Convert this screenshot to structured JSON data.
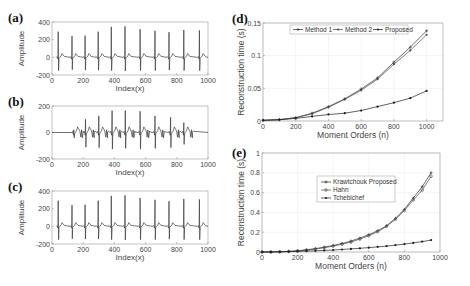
{
  "figure": {
    "panels": [
      "(a)",
      "(b)",
      "(c)",
      "(d)",
      "(e)"
    ]
  },
  "chart_data": [
    {
      "id": "a",
      "type": "line",
      "label": "(a)",
      "title": "",
      "xlabel": "Index(x)",
      "ylabel": "Amplitude",
      "xlim": [
        0,
        1000
      ],
      "ylim": [
        -200,
        400
      ],
      "xticks": [
        0,
        200,
        400,
        600,
        800,
        1000
      ],
      "yticks": [
        -200,
        0,
        200,
        400
      ],
      "signal": "ECG original",
      "beats": [
        {
          "x": 40,
          "r": 290,
          "s": -150
        },
        {
          "x": 128,
          "r": 240,
          "s": -140
        },
        {
          "x": 212,
          "r": 245,
          "s": -145
        },
        {
          "x": 296,
          "r": 290,
          "s": -145
        },
        {
          "x": 380,
          "r": 345,
          "s": -150
        },
        {
          "x": 468,
          "r": 350,
          "s": -155
        },
        {
          "x": 565,
          "r": 320,
          "s": -150
        },
        {
          "x": 660,
          "r": 300,
          "s": -150
        },
        {
          "x": 750,
          "r": 285,
          "s": -145
        },
        {
          "x": 845,
          "r": 310,
          "s": -150
        },
        {
          "x": 945,
          "r": 305,
          "s": -150
        }
      ],
      "grid": false
    },
    {
      "id": "b",
      "type": "line",
      "label": "(b)",
      "title": "",
      "xlabel": "Index(x)",
      "ylabel": "Amplitude",
      "xlim": [
        0,
        1000
      ],
      "ylim": [
        -200,
        200
      ],
      "xticks": [
        0,
        200,
        400,
        600,
        800,
        1000
      ],
      "yticks": [
        -200,
        0,
        200
      ],
      "signal": "ECG noisy/windowed",
      "active_range": [
        130,
        900
      ],
      "beats": [
        {
          "x": 140,
          "r": 20,
          "s": -40
        },
        {
          "x": 215,
          "r": 100,
          "s": -110
        },
        {
          "x": 300,
          "r": 125,
          "s": -115
        },
        {
          "x": 385,
          "r": 165,
          "s": -125
        },
        {
          "x": 470,
          "r": 165,
          "s": -120
        },
        {
          "x": 565,
          "r": 160,
          "s": -125
        },
        {
          "x": 660,
          "r": 125,
          "s": -120
        },
        {
          "x": 760,
          "r": 115,
          "s": -115
        },
        {
          "x": 845,
          "r": 75,
          "s": -90
        }
      ],
      "grid": false
    },
    {
      "id": "c",
      "type": "line",
      "label": "(c)",
      "title": "",
      "xlabel": "Index(x)",
      "ylabel": "Amplitude",
      "xlim": [
        0,
        1000
      ],
      "ylim": [
        -200,
        400
      ],
      "xticks": [
        0,
        200,
        400,
        600,
        800,
        1000
      ],
      "yticks": [
        -200,
        0,
        200,
        400
      ],
      "signal": "ECG reconstructed",
      "beats": [
        {
          "x": 40,
          "r": 290,
          "s": -150
        },
        {
          "x": 128,
          "r": 240,
          "s": -140
        },
        {
          "x": 212,
          "r": 245,
          "s": -145
        },
        {
          "x": 296,
          "r": 290,
          "s": -145
        },
        {
          "x": 380,
          "r": 345,
          "s": -150
        },
        {
          "x": 468,
          "r": 350,
          "s": -155
        },
        {
          "x": 565,
          "r": 320,
          "s": -150
        },
        {
          "x": 660,
          "r": 300,
          "s": -150
        },
        {
          "x": 750,
          "r": 285,
          "s": -145
        },
        {
          "x": 845,
          "r": 310,
          "s": -150
        },
        {
          "x": 945,
          "r": 305,
          "s": -150
        }
      ],
      "grid": false
    },
    {
      "id": "d",
      "type": "line",
      "label": "(d)",
      "title": "",
      "xlabel": "Moment Orders (n)",
      "ylabel": "Reconstruction time (s)",
      "xlim": [
        0,
        1100
      ],
      "ylim": [
        0,
        0.15
      ],
      "xticks": [
        0,
        200,
        400,
        600,
        800,
        1000
      ],
      "yticks": [
        0,
        0.05,
        0.1,
        0.15
      ],
      "ytick_labels": [
        "0",
        "0.05",
        "0.1",
        "0.15"
      ],
      "legend_position": "top (horizontal)",
      "grid": true,
      "x": [
        0,
        100,
        200,
        300,
        400,
        500,
        600,
        700,
        800,
        900,
        1000
      ],
      "series": [
        {
          "name": "Method 1",
          "marker": "+",
          "values": [
            0.001,
            0.002,
            0.005,
            0.012,
            0.022,
            0.034,
            0.049,
            0.066,
            0.09,
            0.113,
            0.138
          ]
        },
        {
          "name": "Method 2",
          "marker": "*",
          "values": [
            0.001,
            0.002,
            0.005,
            0.011,
            0.021,
            0.033,
            0.047,
            0.064,
            0.087,
            0.108,
            0.132
          ]
        },
        {
          "name": "Proposed",
          "marker": ".",
          "values": [
            0.001,
            0.002,
            0.004,
            0.007,
            0.01,
            0.012,
            0.016,
            0.022,
            0.028,
            0.035,
            0.046
          ]
        }
      ]
    },
    {
      "id": "e",
      "type": "line",
      "label": "(e)",
      "title": "",
      "xlabel": "Moment Orders (n)",
      "ylabel": "Reconstruction time (s)",
      "xlim": [
        0,
        1000
      ],
      "ylim": [
        0,
        1
      ],
      "xticks": [
        0,
        200,
        400,
        600,
        800,
        1000
      ],
      "yticks": [
        0,
        0.2,
        0.4,
        0.6,
        0.8,
        1
      ],
      "ytick_labels": [
        "0",
        "0.2",
        "0.4",
        "0.6",
        "0.8",
        "1"
      ],
      "legend_position": "upper center (vertical)",
      "grid": true,
      "x": [
        0,
        50,
        100,
        150,
        200,
        250,
        300,
        350,
        400,
        450,
        500,
        550,
        600,
        650,
        700,
        750,
        800,
        850,
        900,
        950
      ],
      "series": [
        {
          "name": "Krawtchouk Proposed",
          "marker": "+",
          "values": [
            0,
            0,
            0.002,
            0.006,
            0.013,
            0.022,
            0.034,
            0.048,
            0.066,
            0.086,
            0.11,
            0.14,
            0.175,
            0.215,
            0.265,
            0.34,
            0.43,
            0.545,
            0.66,
            0.8
          ]
        },
        {
          "name": "Hahn",
          "marker": "o",
          "values": [
            0,
            0,
            0.002,
            0.005,
            0.011,
            0.019,
            0.03,
            0.043,
            0.06,
            0.079,
            0.1,
            0.13,
            0.165,
            0.205,
            0.26,
            0.33,
            0.42,
            0.525,
            0.625,
            0.765
          ]
        },
        {
          "name": "Tchebichef",
          "marker": "*",
          "values": [
            0,
            0.001,
            0.002,
            0.004,
            0.006,
            0.009,
            0.012,
            0.016,
            0.02,
            0.025,
            0.031,
            0.037,
            0.044,
            0.052,
            0.06,
            0.07,
            0.08,
            0.092,
            0.105,
            0.12
          ]
        }
      ]
    }
  ]
}
